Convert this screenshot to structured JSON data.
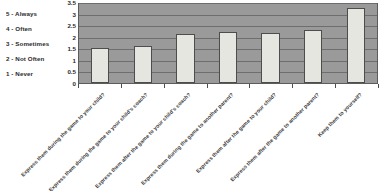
{
  "chart_data": {
    "type": "bar",
    "title": "",
    "subtitle": "",
    "xlabel": "",
    "ylabel": "",
    "ylim": [
      0,
      3.5
    ],
    "ytick_labels": [
      "0",
      "0.5",
      "1",
      "1.5",
      "2",
      "2.5",
      "3",
      "3.5"
    ],
    "ytick_values": [
      0,
      0.5,
      1,
      1.5,
      2,
      2.5,
      3,
      3.5
    ],
    "grid": true,
    "legend_position": "left-outside",
    "categories": [
      "Express them during the game to your child?",
      "Express them during the game to your child's coach?",
      "Express them after the game to your child's coach?",
      "Express them during the game to another parent?",
      "Express them after the game to your child?",
      "Express them after the game to another parent?",
      "Keep them to yourself?"
    ],
    "values": [
      1.5,
      1.62,
      2.1,
      2.2,
      2.17,
      2.3,
      3.22
    ],
    "series": [
      {
        "name": "Average response",
        "values": [
          1.5,
          1.62,
          2.1,
          2.2,
          2.17,
          2.3,
          3.22
        ]
      }
    ],
    "scale_key": [
      "5 - Always",
      "4 - Often",
      "3 - Sometimes",
      "2 - Not Often",
      "1 - Never"
    ],
    "colors": {
      "plot_background": "#9a9a9a",
      "bar_fill": "#e6e6e1",
      "bar_border": "#4d4d4d",
      "gridline": "#6e6e6e",
      "text": "#2b2b2b"
    }
  }
}
